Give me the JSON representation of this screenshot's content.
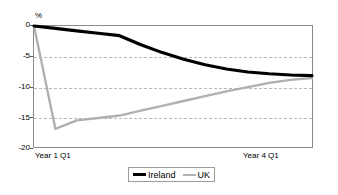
{
  "chart_data": {
    "type": "line",
    "title": "",
    "subtitle": "",
    "xlabel": "",
    "ylabel": "%",
    "ylim": [
      -20,
      0
    ],
    "xlim": [
      0,
      13
    ],
    "grid": true,
    "grid_axis": "y",
    "grid_style": "dashed",
    "legend_position": "bottom-center",
    "yticks": [
      0,
      -5,
      -10,
      -15,
      -20
    ],
    "ytick_labels": [
      "0",
      "-5",
      "-10",
      "-15",
      "-20"
    ],
    "xtick_positions": [
      0,
      12
    ],
    "xtick_labels": [
      "Year 1 Q1",
      "Year 4 Q1"
    ],
    "x": [
      0,
      1,
      2,
      3,
      4,
      5,
      6,
      7,
      8,
      9,
      10,
      11,
      12,
      13
    ],
    "series": [
      {
        "name": "Ireland",
        "color": "#000000",
        "line_width": 3.2,
        "values": [
          0.0,
          -0.4,
          -0.8,
          -1.2,
          -1.6,
          -3.1,
          -4.4,
          -5.5,
          -6.4,
          -7.1,
          -7.6,
          -7.9,
          -8.1,
          -8.2
        ]
      },
      {
        "name": "UK",
        "color": "#b0b0b0",
        "line_width": 2.4,
        "values": [
          0.0,
          -17.0,
          -15.6,
          -15.2,
          -14.8,
          -14.0,
          -13.2,
          -12.4,
          -11.6,
          -10.8,
          -10.1,
          -9.4,
          -8.9,
          -8.6
        ]
      }
    ]
  },
  "axis": {
    "unit_label": "%",
    "y_labels": [
      "0",
      "-5",
      "-10",
      "-15",
      "-20"
    ],
    "x_label_left": "Year 1 Q1",
    "x_label_right": "Year 4 Q1"
  },
  "legend": {
    "items": [
      {
        "label": "Ireland",
        "color": "#000000"
      },
      {
        "label": "UK",
        "color": "#b0b0b0"
      }
    ]
  },
  "colors": {
    "ireland": "#000000",
    "uk": "#b0b0b0",
    "gridline": "#b9b9b9",
    "frame": "#8a8a8a",
    "background": "#ffffff"
  }
}
